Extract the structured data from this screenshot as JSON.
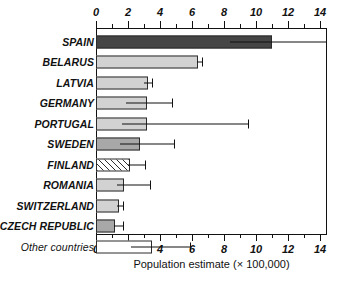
{
  "chart_data": {
    "type": "bar",
    "orientation": "horizontal",
    "title": "",
    "xlabel": "Population estimate (× 100,000)",
    "ylabel": "",
    "xlim": [
      0,
      14.4
    ],
    "xticks": [
      0,
      2,
      4,
      6,
      8,
      10,
      12,
      14
    ],
    "xtick_labels": [
      "0",
      "2",
      "4",
      "6",
      "8",
      "10",
      "12",
      "14"
    ],
    "xminor_ticks": [
      1,
      3,
      5,
      7,
      9,
      11,
      13
    ],
    "grid": false,
    "legend": "none",
    "axis_note": "tick labels shown on both top and bottom axes",
    "categories": [
      "SPAIN",
      "BELARUS",
      "LATVIA",
      "GERMANY",
      "PORTUGAL",
      "SWEDEN",
      "FINLAND",
      "ROMANIA",
      "SWITZERLAND",
      "CZECH REPUBLIC",
      "Other countries"
    ],
    "values": [
      11.0,
      6.4,
      3.25,
      3.2,
      3.2,
      2.75,
      2.1,
      1.75,
      1.45,
      1.2,
      3.5
    ],
    "error_low": [
      8.4,
      6.3,
      3.0,
      1.9,
      1.6,
      1.5,
      2.0,
      1.3,
      1.3,
      1.1,
      2.2
    ],
    "error_high": [
      14.4,
      6.6,
      3.5,
      4.75,
      9.5,
      4.9,
      3.05,
      3.4,
      1.7,
      1.7,
      5.85
    ],
    "fills": [
      "#454545",
      "#d2d2d2",
      "#d2d2d2",
      "#d2d2d2",
      "#d2d2d2",
      "#a8a8a8",
      "hatched",
      "#d2d2d2",
      "#d2d2d2",
      "#a8a8a8",
      "#ffffff"
    ]
  },
  "colors": {
    "axis": "#111111",
    "bar_edge": "#2b2b2b",
    "background": "#ffffff",
    "dark_bar": "#454545",
    "light_bar": "#d2d2d2",
    "medium_bar": "#a8a8a8",
    "white_bar": "#ffffff"
  }
}
